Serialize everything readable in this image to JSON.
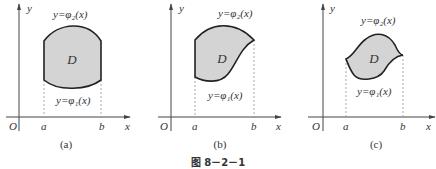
{
  "figure_caption": "图 8－2－1",
  "panels": [
    {
      "id": "a",
      "sublabel": "(a)",
      "axis_x": "x",
      "axis_y": "y",
      "origin": "O",
      "tick_a": "a",
      "tick_b": "b",
      "region": "D",
      "upper_curve": "y=φ₂(x)",
      "lower_curve": "y=φ₁(x)"
    },
    {
      "id": "b",
      "sublabel": "(b)",
      "axis_x": "x",
      "axis_y": "y",
      "origin": "O",
      "tick_a": "a",
      "tick_b": "b",
      "region": "D",
      "upper_curve": "y=φ₂(x)",
      "lower_curve": "y=φ₁(x)"
    },
    {
      "id": "c",
      "sublabel": "(c)",
      "axis_x": "x",
      "axis_y": "y",
      "origin": "O",
      "tick_a": "a",
      "tick_b": "b",
      "region": "D",
      "upper_curve": "y=φ₂(x)",
      "lower_curve": "y=φ₁(x)"
    }
  ],
  "colors": {
    "region_fill": "#d4d4d4",
    "boundary": "#222222",
    "axis": "#444444",
    "dashed": "#888888"
  }
}
